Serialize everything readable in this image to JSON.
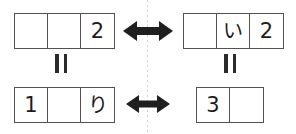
{
  "diagram": {
    "axis": {
      "name": "mirror-axis",
      "style": "dotted-vertical",
      "color": "#d8d2d2"
    },
    "grids": [
      {
        "id": "top-left",
        "cells": [
          "",
          "",
          "2"
        ],
        "cell_count": 3
      },
      {
        "id": "top-right",
        "cells": [
          "",
          "い",
          "2"
        ],
        "cell_count": 3
      },
      {
        "id": "bottom-left",
        "cells": [
          "1",
          "",
          "り"
        ],
        "cell_count": 3
      },
      {
        "id": "bottom-right",
        "cells": [
          "3",
          ""
        ],
        "cell_count": 2
      }
    ],
    "arrows": [
      {
        "id": "top",
        "glyph": "⟷",
        "direction": "double-headed-horizontal"
      },
      {
        "id": "bottom",
        "glyph": "⟷",
        "direction": "double-headed-horizontal"
      }
    ],
    "equals": [
      {
        "id": "left",
        "symbol": "=",
        "rotation": "90deg"
      },
      {
        "id": "right",
        "symbol": "=",
        "rotation": "90deg"
      }
    ],
    "colors": {
      "stroke": "#555053",
      "text": "#1c1c1c",
      "arrow": "#1f1f1f",
      "axis": "#d8d2d2",
      "background": "#ffffff"
    }
  }
}
